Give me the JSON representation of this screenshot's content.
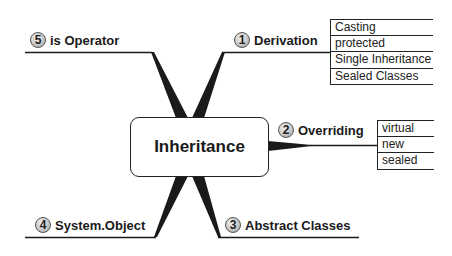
{
  "diagram": {
    "type": "mind-map",
    "central_node": {
      "label": "Inheritance"
    },
    "branches": [
      {
        "number": "1",
        "label": "Derivation",
        "position": "top-right",
        "children": [
          "Casting",
          "protected",
          "Single Inheritance",
          "Sealed Classes"
        ]
      },
      {
        "number": "2",
        "label": "Overriding",
        "position": "right",
        "children": [
          "virtual",
          "new",
          "sealed"
        ]
      },
      {
        "number": "3",
        "label": "Abstract Classes",
        "position": "bottom-right",
        "children": []
      },
      {
        "number": "4",
        "label": "System.Object",
        "position": "bottom-left",
        "children": []
      },
      {
        "number": "5",
        "label": "is Operator",
        "position": "top-left",
        "children": []
      }
    ],
    "colors": {
      "line": "#1a1a1a",
      "badge_fill": "#c8c8c8",
      "background": "#ffffff"
    }
  }
}
